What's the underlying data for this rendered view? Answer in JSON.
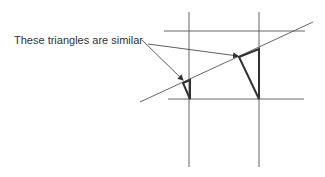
{
  "diagram": {
    "label": "These triangles are similar",
    "colors": {
      "background": "#ffffff",
      "thin_line": "#555555",
      "thick_line": "#333333",
      "text": "#333333"
    },
    "lines": {
      "vertical": [
        {
          "x": 189,
          "y1": 12,
          "y2": 167
        },
        {
          "x": 259,
          "y1": 12,
          "y2": 167
        }
      ],
      "horizontal": [
        {
          "y": 31,
          "x1": 164,
          "x2": 305
        },
        {
          "y": 99,
          "x1": 168,
          "x2": 304
        }
      ],
      "transversal": {
        "x1": 140,
        "y1": 102,
        "x2": 313,
        "y2": 22
      }
    },
    "triangles": [
      {
        "name": "small",
        "points": [
          [
            183,
            83
          ],
          [
            190,
            80
          ],
          [
            190,
            99
          ]
        ]
      },
      {
        "name": "large",
        "points": [
          [
            239,
            57
          ],
          [
            259,
            49
          ],
          [
            259,
            99
          ]
        ]
      }
    ],
    "arrows": [
      {
        "target": "small",
        "from": [
          142,
          40
        ],
        "to": [
          183,
          80
        ]
      },
      {
        "target": "large",
        "from": [
          148,
          44
        ],
        "to": [
          238,
          56
        ]
      }
    ]
  }
}
